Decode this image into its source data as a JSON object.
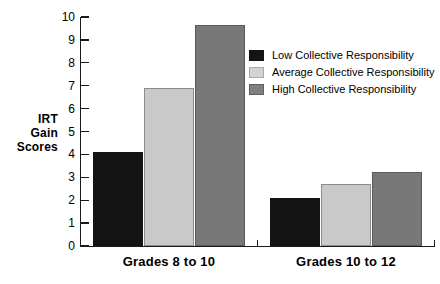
{
  "chart_data": {
    "type": "bar",
    "title": "",
    "xlabel": "",
    "ylabel": "IRT Gain Scores",
    "ylabel_lines": [
      "IRT",
      "Gain",
      "Scores"
    ],
    "categories": [
      "Grades 8 to 10",
      "Grades 10 to 12"
    ],
    "series": [
      {
        "name": "Low Collective Responsibility",
        "color": "#141414",
        "values": [
          4.1,
          2.1
        ]
      },
      {
        "name": "Average Collective Responsibility",
        "color": "#c9c9c9",
        "values": [
          6.9,
          2.7
        ]
      },
      {
        "name": "High Collective Responsibility",
        "color": "#787878",
        "values": [
          9.65,
          3.25
        ]
      }
    ],
    "ylim": [
      0,
      10
    ],
    "ytick_labels": [
      "0",
      "1",
      "2",
      "3",
      "4",
      "5",
      "6",
      "7",
      "8",
      "9",
      "10"
    ],
    "ytick_values": [
      0,
      1,
      2,
      3,
      4,
      5,
      6,
      7,
      8,
      9,
      10
    ],
    "grid": false,
    "legend_position": "upper right"
  },
  "legend": {
    "items": [
      {
        "label": "Low Collective Responsibility"
      },
      {
        "label": "Average Collective Responsibility"
      },
      {
        "label": "High Collective Responsibility"
      }
    ]
  }
}
